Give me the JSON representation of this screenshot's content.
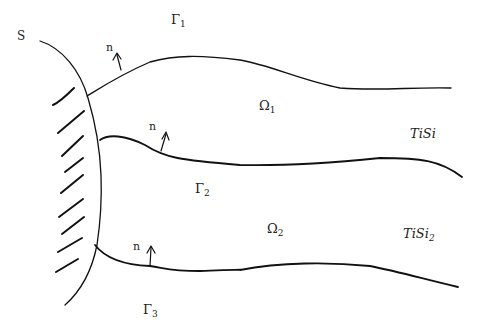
{
  "diagram": {
    "labels": {
      "S": "S",
      "gamma1": "Γ",
      "gamma1_sub": "1",
      "gamma2": "Γ",
      "gamma2_sub": "2",
      "gamma3": "Γ",
      "gamma3_sub": "3",
      "omega1": "Ω",
      "omega1_sub": "1",
      "omega2": "Ω",
      "omega2_sub": "2",
      "tisi": "TiSi",
      "tisi2": "TiSi",
      "tisi2_sub": "2",
      "normal_top": "n",
      "normal_mid": "n",
      "normal_bottom": "n"
    },
    "stroke_color": "#111111",
    "background": "#ffffff"
  }
}
